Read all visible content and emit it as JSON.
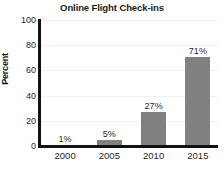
{
  "chart_data": {
    "type": "bar",
    "title": "Online Flight Check-ins",
    "xlabel": "",
    "ylabel": "Percent",
    "categories": [
      "2000",
      "2005",
      "2010",
      "2015"
    ],
    "values": [
      1,
      5,
      27,
      71
    ],
    "data_labels": [
      "1%",
      "5%",
      "27%",
      "71%"
    ],
    "ylim": [
      0,
      100
    ],
    "yticks": [
      0,
      20,
      40,
      60,
      80,
      100
    ],
    "ytick_labels": [
      "0",
      "20",
      "40",
      "60",
      "80",
      "100"
    ],
    "grid": true,
    "legend": false,
    "bar_color": "#808080",
    "axis_color": "#111111",
    "grid_color": "#eef0f4",
    "background": "#ffffff"
  }
}
